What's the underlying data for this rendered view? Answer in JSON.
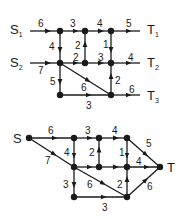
{
  "diagrams": [
    {
      "id": "multi-source-network",
      "sources": [
        {
          "label": "S",
          "sub": "1",
          "x": 10,
          "y": 34
        },
        {
          "label": "S",
          "sub": "2",
          "x": 10,
          "y": 67
        }
      ],
      "sinks": [
        {
          "label": "T",
          "sub": "1",
          "x": 147,
          "y": 34
        },
        {
          "label": "T",
          "sub": "2",
          "x": 147,
          "y": 67
        },
        {
          "label": "T",
          "sub": "3",
          "x": 147,
          "y": 100
        }
      ],
      "nodes": [
        {
          "id": "a",
          "x": 60,
          "y": 31
        },
        {
          "id": "b",
          "x": 85,
          "y": 31
        },
        {
          "id": "c",
          "x": 111,
          "y": 31
        },
        {
          "id": "d",
          "x": 60,
          "y": 63
        },
        {
          "id": "e",
          "x": 85,
          "y": 63
        },
        {
          "id": "f",
          "x": 111,
          "y": 63
        },
        {
          "id": "g",
          "x": 60,
          "y": 95
        },
        {
          "id": "h",
          "x": 111,
          "y": 95
        }
      ],
      "edges": [
        {
          "from": [
            30,
            31
          ],
          "to": [
            60,
            31
          ],
          "weight": "6",
          "lx": 38,
          "ly": 27
        },
        {
          "from": [
            60,
            31
          ],
          "to": [
            85,
            31
          ],
          "weight": "3",
          "lx": 70,
          "ly": 27
        },
        {
          "from": [
            85,
            31
          ],
          "to": [
            111,
            31
          ],
          "weight": "4",
          "lx": 97,
          "ly": 27
        },
        {
          "from": [
            111,
            31
          ],
          "to": [
            140,
            31
          ],
          "weight": "5",
          "lx": 126,
          "ly": 27
        },
        {
          "from": [
            30,
            63
          ],
          "to": [
            60,
            63
          ],
          "weight": "7",
          "lx": 38,
          "ly": 74
        },
        {
          "from": [
            60,
            63
          ],
          "to": [
            85,
            63
          ],
          "weight": "2",
          "lx": 73,
          "ly": 61
        },
        {
          "from": [
            85,
            63
          ],
          "to": [
            111,
            63
          ],
          "weight": "3",
          "lx": 98,
          "ly": 61
        },
        {
          "from": [
            111,
            63
          ],
          "to": [
            140,
            63
          ],
          "weight": "4",
          "lx": 128,
          "ly": 61
        },
        {
          "from": [
            60,
            31
          ],
          "to": [
            60,
            63
          ],
          "weight": "4",
          "lx": 49,
          "ly": 50
        },
        {
          "from": [
            85,
            63
          ],
          "to": [
            85,
            31
          ],
          "weight": "2",
          "lx": 75,
          "ly": 49
        },
        {
          "from": [
            111,
            31
          ],
          "to": [
            111,
            63
          ],
          "weight": "1",
          "lx": 103,
          "ly": 48
        },
        {
          "from": [
            60,
            63
          ],
          "to": [
            60,
            95
          ],
          "weight": "5",
          "lx": 50,
          "ly": 85
        },
        {
          "from": [
            111,
            95
          ],
          "to": [
            111,
            63
          ],
          "weight": "2",
          "lx": 115,
          "ly": 84
        },
        {
          "from": [
            60,
            63
          ],
          "to": [
            111,
            95
          ],
          "weight": "6",
          "lx": 81,
          "ly": 91
        },
        {
          "from": [
            60,
            95
          ],
          "to": [
            111,
            95
          ],
          "weight": "3",
          "lx": 86,
          "ly": 109
        },
        {
          "from": [
            111,
            95
          ],
          "to": [
            140,
            95
          ],
          "weight": "6",
          "lx": 129,
          "ly": 93
        }
      ]
    },
    {
      "id": "single-source-network",
      "sources": [
        {
          "label": "S",
          "sub": "",
          "x": 13,
          "y": 143
        }
      ],
      "sinks": [
        {
          "label": "T",
          "sub": "",
          "x": 167,
          "y": 172
        }
      ],
      "nodes": [
        {
          "id": "s",
          "x": 29,
          "y": 138
        },
        {
          "id": "a",
          "x": 74,
          "y": 138
        },
        {
          "id": "b",
          "x": 99,
          "y": 138
        },
        {
          "id": "c",
          "x": 127,
          "y": 138
        },
        {
          "id": "d",
          "x": 74,
          "y": 167
        },
        {
          "id": "e",
          "x": 99,
          "y": 167
        },
        {
          "id": "f",
          "x": 127,
          "y": 167
        },
        {
          "id": "t",
          "x": 160,
          "y": 167
        },
        {
          "id": "g",
          "x": 74,
          "y": 197
        },
        {
          "id": "h",
          "x": 127,
          "y": 197
        }
      ],
      "edges": [
        {
          "from": [
            29,
            138
          ],
          "to": [
            74,
            138
          ],
          "weight": "6",
          "lx": 48,
          "ly": 134
        },
        {
          "from": [
            74,
            138
          ],
          "to": [
            99,
            138
          ],
          "weight": "3",
          "lx": 85,
          "ly": 134
        },
        {
          "from": [
            99,
            138
          ],
          "to": [
            127,
            138
          ],
          "weight": "4",
          "lx": 112,
          "ly": 134
        },
        {
          "from": [
            29,
            138
          ],
          "to": [
            74,
            167
          ],
          "weight": "7",
          "lx": 45,
          "ly": 164
        },
        {
          "from": [
            127,
            138
          ],
          "to": [
            160,
            167
          ],
          "weight": "5",
          "lx": 146,
          "ly": 147
        },
        {
          "from": [
            74,
            167
          ],
          "to": [
            99,
            167
          ],
          "weight": "",
          "lx": 0,
          "ly": 0
        },
        {
          "from": [
            99,
            167
          ],
          "to": [
            127,
            167
          ],
          "weight": "",
          "lx": 0,
          "ly": 0
        },
        {
          "from": [
            127,
            167
          ],
          "to": [
            160,
            167
          ],
          "weight": "4",
          "lx": 136,
          "ly": 165
        },
        {
          "from": [
            74,
            138
          ],
          "to": [
            74,
            167
          ],
          "weight": "4",
          "lx": 64,
          "ly": 156
        },
        {
          "from": [
            99,
            167
          ],
          "to": [
            99,
            138
          ],
          "weight": "2",
          "lx": 89,
          "ly": 156
        },
        {
          "from": [
            127,
            138
          ],
          "to": [
            127,
            167
          ],
          "weight": "1",
          "lx": 119,
          "ly": 156
        },
        {
          "from": [
            74,
            167
          ],
          "to": [
            74,
            197
          ],
          "weight": "3",
          "lx": 63,
          "ly": 188
        },
        {
          "from": [
            127,
            197
          ],
          "to": [
            127,
            167
          ],
          "weight": "2",
          "lx": 117,
          "ly": 188
        },
        {
          "from": [
            74,
            167
          ],
          "to": [
            127,
            197
          ],
          "weight": "6",
          "lx": 87,
          "ly": 188
        },
        {
          "from": [
            74,
            197
          ],
          "to": [
            127,
            197
          ],
          "weight": "3",
          "lx": 102,
          "ly": 211
        },
        {
          "from": [
            127,
            197
          ],
          "to": [
            160,
            167
          ],
          "weight": "6",
          "lx": 147,
          "ly": 190
        }
      ]
    }
  ]
}
